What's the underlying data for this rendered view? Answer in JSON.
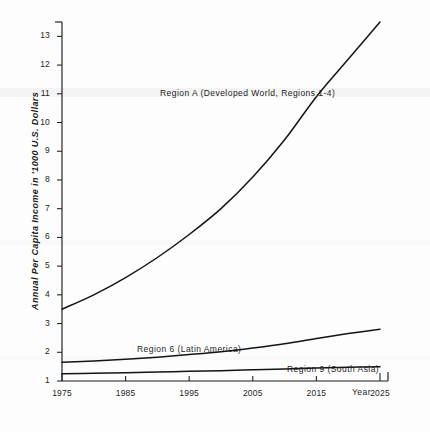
{
  "figure": {
    "background_color": "#fdfdfd",
    "ink_color": "#141414"
  },
  "chart_data": {
    "type": "line",
    "title": "",
    "subtitle": "",
    "xlabel": "Year",
    "ylabel": "Annual Per Capita Income in '1000 U.S. Dollars",
    "xlim": [
      1975,
      2025
    ],
    "ylim": [
      1,
      13.5
    ],
    "grid": false,
    "legend_position": "inline-annotations",
    "xticks": [
      1975,
      1985,
      1995,
      2005,
      2015,
      2025
    ],
    "xtick_labels": [
      "1975",
      "1985",
      "1995",
      "2005",
      "2015",
      "2025"
    ],
    "yticks": [
      1,
      2,
      3,
      4,
      5,
      6,
      7,
      8,
      9,
      10,
      11,
      12,
      13
    ],
    "ytick_labels": [
      "1",
      "2",
      "3",
      "4",
      "5",
      "6",
      "7",
      "8",
      "9",
      "10",
      "11",
      "12",
      "13"
    ],
    "x": [
      1975,
      1980,
      1985,
      1990,
      1995,
      2000,
      2005,
      2010,
      2015,
      2020,
      2025
    ],
    "series": [
      {
        "name": "Region A (Developed World, Regions 1-4)",
        "values": [
          3.5,
          4.0,
          4.6,
          5.3,
          6.1,
          7.0,
          8.1,
          9.4,
          10.9,
          12.2,
          13.5
        ]
      },
      {
        "name": "Region 6 (Latin America)",
        "values": [
          1.65,
          1.7,
          1.76,
          1.83,
          1.92,
          2.02,
          2.15,
          2.3,
          2.48,
          2.65,
          2.8
        ]
      },
      {
        "name": "Region 9 (South Asia)",
        "values": [
          1.25,
          1.27,
          1.29,
          1.31,
          1.34,
          1.36,
          1.39,
          1.42,
          1.45,
          1.48,
          1.5
        ]
      }
    ],
    "annotations": [
      {
        "text": "Region A (Developed World, Regions 1-4)",
        "for_series": "Region A (Developed World, Regions 1-4)"
      },
      {
        "text": "Region 6 (Latin America)",
        "for_series": "Region 6 (Latin America)"
      },
      {
        "text": "Region 9 (South Asia)",
        "for_series": "Region 9 (South Asia)"
      }
    ],
    "axis_note": "Year"
  }
}
